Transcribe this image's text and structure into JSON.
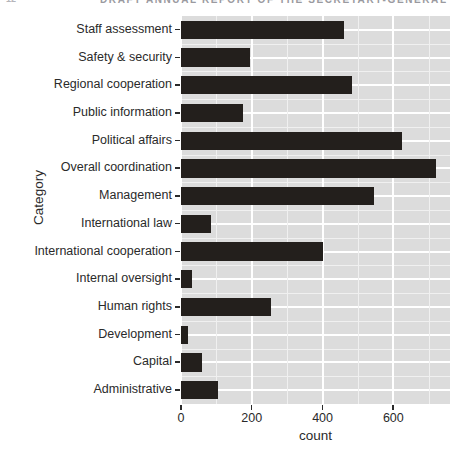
{
  "page_header": {
    "visible": true,
    "note": "cut-off running header at very top of page",
    "folio": "12",
    "text": "DRAFT ANNUAL REPORT OF THE SECRETARY-GENERAL"
  },
  "chart_data": {
    "type": "bar",
    "orientation": "horizontal",
    "title": "",
    "xlabel": "count",
    "ylabel": "Category",
    "categories": [
      "Staff assessment",
      "Safety & security",
      "Regional cooperation",
      "Public information",
      "Political affairs",
      "Overall coordination",
      "Management",
      "International law",
      "International cooperation",
      "Internal oversight",
      "Human rights",
      "Development",
      "Capital",
      "Administrative"
    ],
    "values": [
      460,
      195,
      483,
      175,
      625,
      720,
      545,
      85,
      400,
      30,
      255,
      20,
      60,
      105
    ],
    "xlim": [
      0,
      760
    ],
    "ylim": null,
    "xticks": [
      0,
      200,
      400,
      600
    ],
    "xticklabels": [
      "0",
      "200",
      "400",
      "600"
    ],
    "x_minor_ticks": [
      100,
      300,
      500,
      700
    ],
    "grid": true,
    "legend": null,
    "legend_position": "none",
    "bar_color": "#231f1c",
    "panel_color": "#dcdcdc",
    "gridline_color": "#ffffff"
  },
  "axis": {
    "x_title": "count",
    "y_title": "Category"
  },
  "colors": {
    "bar": "#231f1c",
    "panel": "#dcdcdc",
    "grid_major": "#ffffff",
    "grid_minor": "#f0f0f0",
    "text": "#2a2a2a",
    "background": "#ffffff"
  }
}
